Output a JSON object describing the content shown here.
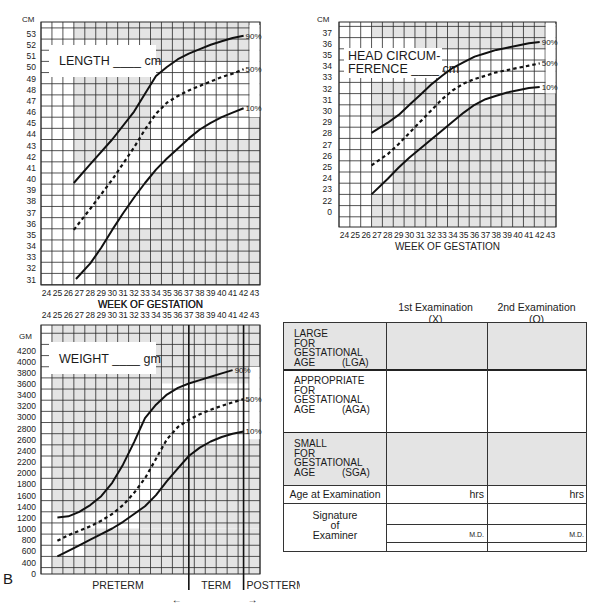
{
  "chart_data": [
    {
      "id": "length",
      "type": "line",
      "title": "LENGTH ____ cm",
      "unit_label": "CM",
      "xlabel": "WEEK OF GESTATION",
      "ylabel": "CM",
      "x_ticks": [
        24,
        25,
        26,
        27,
        28,
        29,
        30,
        31,
        32,
        33,
        34,
        35,
        36,
        37,
        38,
        39,
        40,
        41,
        42,
        43
      ],
      "y_ticks": [
        31,
        32,
        33,
        34,
        35,
        36,
        37,
        38,
        39,
        40,
        41,
        42,
        43,
        44,
        45,
        46,
        47,
        48,
        49,
        50,
        51,
        52,
        53
      ],
      "ylim": [
        30.5,
        54
      ],
      "series": [
        {
          "name": "90%",
          "style": "solid",
          "x": [
            26.5,
            28,
            30,
            32,
            33,
            34,
            35,
            36,
            37,
            38,
            39,
            40,
            41,
            42
          ],
          "y": [
            39.6,
            41.3,
            43.5,
            46.0,
            47.6,
            49.2,
            50.0,
            50.7,
            51.2,
            51.6,
            52.0,
            52.3,
            52.6,
            52.8
          ]
        },
        {
          "name": "50%",
          "style": "dashed",
          "x": [
            26.5,
            28,
            30,
            32,
            33,
            34,
            35,
            36,
            37,
            38,
            39,
            40,
            41,
            42
          ],
          "y": [
            35.4,
            37.3,
            39.9,
            42.8,
            44.4,
            45.8,
            46.8,
            47.4,
            47.9,
            48.3,
            48.7,
            49.1,
            49.4,
            49.8
          ]
        },
        {
          "name": "10%",
          "style": "solid",
          "x": [
            26.7,
            28,
            29,
            30,
            31,
            32,
            33,
            34,
            35,
            36,
            37,
            38,
            39,
            40,
            41,
            42
          ],
          "y": [
            31.0,
            32.4,
            33.8,
            35.4,
            36.9,
            38.3,
            39.6,
            40.8,
            41.8,
            42.7,
            43.6,
            44.4,
            45.0,
            45.5,
            45.9,
            46.3
          ]
        }
      ],
      "legend_labels": [
        "90%",
        "50%",
        "10%"
      ]
    },
    {
      "id": "head",
      "type": "line",
      "title": "HEAD CIRCUMFERENCE ____ cm",
      "unit_label": "CM",
      "xlabel": "WEEK OF GESTATION",
      "ylabel": "CM",
      "x_ticks": [
        24,
        25,
        26,
        27,
        28,
        29,
        30,
        31,
        32,
        33,
        34,
        35,
        36,
        37,
        38,
        39,
        40,
        41,
        42,
        43
      ],
      "y_ticks": [
        0,
        22,
        23,
        24,
        25,
        26,
        27,
        28,
        29,
        30,
        31,
        32,
        33,
        34,
        35,
        36,
        37
      ],
      "ylim": [
        0,
        37
      ],
      "series": [
        {
          "name": "90%",
          "style": "solid",
          "x": [
            26.5,
            28,
            29,
            30,
            31,
            32,
            33,
            34,
            35,
            36,
            37,
            38,
            39,
            40,
            41,
            42
          ],
          "y": [
            28.0,
            28.9,
            29.6,
            30.5,
            31.4,
            32.3,
            33.1,
            33.8,
            34.3,
            34.8,
            35.1,
            35.4,
            35.6,
            35.8,
            36.0,
            36.1
          ]
        },
        {
          "name": "50%",
          "style": "dashed",
          "x": [
            26.5,
            28,
            29,
            30,
            31,
            32,
            33,
            34,
            35,
            36,
            37,
            38,
            39,
            40,
            41,
            42
          ],
          "y": [
            25.1,
            26.1,
            27.0,
            28.0,
            29.0,
            30.0,
            31.0,
            31.8,
            32.4,
            32.8,
            33.1,
            33.4,
            33.6,
            33.8,
            34.0,
            34.2
          ]
        },
        {
          "name": "10%",
          "style": "solid",
          "x": [
            26.5,
            28,
            29,
            30,
            31,
            32,
            33,
            34,
            35,
            36,
            37,
            38,
            39,
            40,
            41,
            42
          ],
          "y": [
            22.5,
            23.9,
            24.9,
            25.8,
            26.6,
            27.4,
            28.2,
            29.0,
            29.8,
            30.5,
            31.0,
            31.3,
            31.6,
            31.8,
            32.0,
            32.1
          ]
        }
      ],
      "legend_labels": [
        "90%",
        "50%",
        "10%"
      ]
    },
    {
      "id": "weight",
      "type": "line",
      "title": "WEIGHT ____ gm",
      "unit_label": "GM",
      "xlabel": "WEEK OF GESTATION",
      "ylabel": "GM",
      "x_ticks": [
        24,
        25,
        26,
        27,
        28,
        29,
        30,
        31,
        32,
        33,
        34,
        35,
        36,
        37,
        38,
        39,
        40,
        41,
        42,
        43
      ],
      "y_ticks": [
        0,
        400,
        600,
        800,
        1000,
        1200,
        1400,
        1600,
        1800,
        2000,
        2200,
        2400,
        2600,
        2800,
        3000,
        3200,
        3400,
        3600,
        3800,
        4000,
        4200
      ],
      "ylim": [
        0,
        4400
      ],
      "series": [
        {
          "name": "90%",
          "style": "solid",
          "x": [
            25,
            26,
            27,
            28,
            29,
            30,
            31,
            32,
            33,
            34,
            35,
            36,
            37,
            38,
            39,
            40,
            41,
            42
          ],
          "y": [
            1200,
            1220,
            1300,
            1420,
            1580,
            1820,
            2150,
            2550,
            2980,
            3220,
            3400,
            3520,
            3600,
            3660,
            3720,
            3780,
            3840
          ]
        },
        {
          "name": "50%",
          "style": "dashed",
          "x": [
            25,
            26,
            27,
            28,
            29,
            30,
            31,
            32,
            33,
            34,
            35,
            36,
            37,
            38,
            39,
            40,
            41,
            42
          ],
          "y": [
            780,
            880,
            960,
            1040,
            1140,
            1260,
            1420,
            1640,
            1900,
            2250,
            2600,
            2820,
            2950,
            3050,
            3130,
            3200,
            3260,
            3320
          ]
        },
        {
          "name": "10%",
          "style": "solid",
          "x": [
            25,
            26,
            27,
            28,
            29,
            30,
            31,
            32,
            33,
            34,
            35,
            36,
            37,
            38,
            39,
            40,
            41,
            42
          ],
          "y": [
            500,
            600,
            700,
            800,
            900,
            1000,
            1120,
            1260,
            1400,
            1600,
            1850,
            2080,
            2300,
            2450,
            2560,
            2640,
            2700,
            2740
          ]
        }
      ],
      "legend_labels": [
        "90%",
        "50%",
        "10%"
      ],
      "period_labels": [
        "PRETERM",
        "TERM",
        "POSTTERM"
      ],
      "period_boundaries": [
        37,
        42
      ]
    }
  ],
  "classification_table": {
    "columns": [
      {
        "title": "1st Examination",
        "symbol": "(X)"
      },
      {
        "title": "2nd Examination",
        "symbol": "(O)"
      }
    ],
    "rows": [
      {
        "lines": [
          "LARGE",
          "FOR",
          "GESTATIONAL",
          "AGE"
        ],
        "abbr": "(LGA)",
        "shaded": true
      },
      {
        "lines": [
          "APPROPRIATE",
          "FOR",
          "GESTATIONAL",
          "AGE"
        ],
        "abbr": "(AGA)",
        "shaded": false
      },
      {
        "lines": [
          "SMALL",
          "FOR",
          "GESTATIONAL",
          "AGE"
        ],
        "abbr": "(SGA)",
        "shaded": true
      }
    ],
    "age_label": "Age at Examination",
    "age_unit": "hrs",
    "signature_label": [
      "Signature",
      "of",
      "Examiner"
    ],
    "signature_suffix": "M.D."
  },
  "panel_letter": "B",
  "colors": {
    "grid_line": "#2a2a2a",
    "shade": "#e4e4e4",
    "curve": "#111111",
    "border": "#333333"
  }
}
